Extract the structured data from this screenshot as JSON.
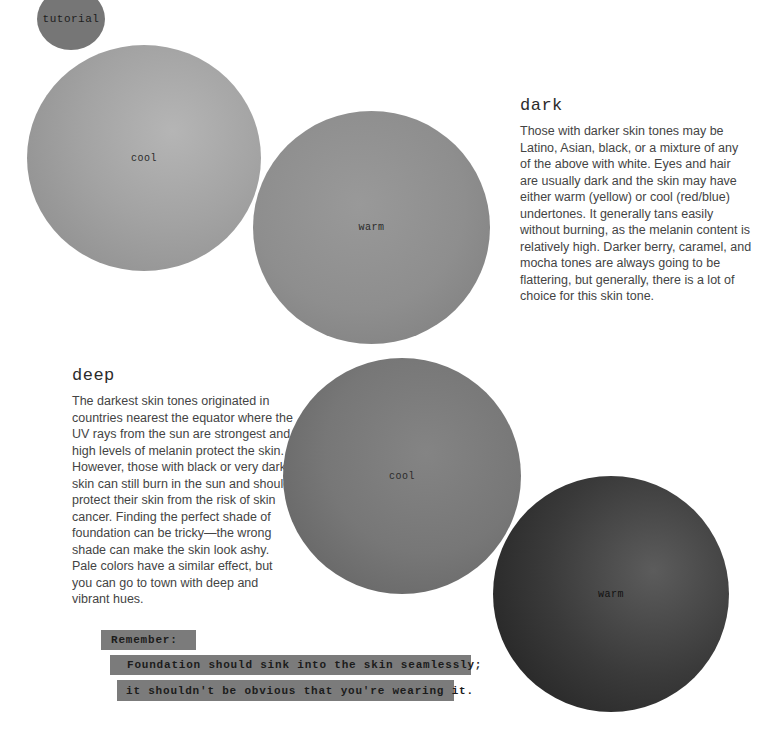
{
  "badge": {
    "label": "tutorial"
  },
  "swatches": [
    {
      "label": "cool",
      "group": "dark",
      "color": "#a3a3a3"
    },
    {
      "label": "warm",
      "group": "dark",
      "color": "#8e8e8e"
    },
    {
      "label": "cool",
      "group": "deep",
      "color": "#777777"
    },
    {
      "label": "warm",
      "group": "deep",
      "color": "#3a3a3a"
    }
  ],
  "sections": {
    "dark": {
      "heading": "dark",
      "body": "Those with darker skin tones may be Latino, Asian, black, or a mixture of any of the above with white. Eyes and hair are usually dark and the skin may have either warm (yellow) or cool (red/blue) undertones. It generally tans easily without burning, as the melanin content is relatively high. Darker berry, caramel, and mocha tones are always going to be flattering, but generally, there is a lot of choice for this skin tone."
    },
    "deep": {
      "heading": "deep",
      "body": "The darkest skin tones originated in countries nearest the equator where the UV rays from the sun are strongest and high levels of melanin protect the skin. However, those with black or very dark skin can still burn in the sun and should protect their skin from the risk of skin cancer. Finding the perfect shade of foundation can be tricky—the wrong shade can make the skin look ashy. Pale colors have a similar effect, but you can go to town with deep and vibrant hues."
    }
  },
  "note": {
    "title": "Remember:",
    "line1": "Foundation should sink into the skin seamlessly;",
    "line2": "it shouldn't be obvious that you're wearing it."
  }
}
